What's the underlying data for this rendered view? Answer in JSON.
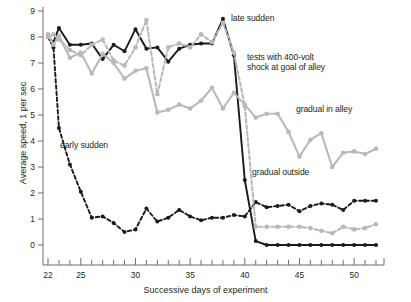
{
  "chart_data": {
    "type": "line",
    "title": "",
    "xlabel": "Successive days of experiment",
    "ylabel": "Average speed, 1 per sec",
    "xlim": [
      21.4,
      52.6
    ],
    "ylim": [
      -0.35,
      9.0
    ],
    "xticks_major": [
      22,
      25,
      30,
      35,
      40,
      45,
      50
    ],
    "xticks_minor_range": [
      22,
      52
    ],
    "yticks": [
      0,
      1,
      2,
      3,
      4,
      5,
      6,
      7,
      8,
      9
    ],
    "grid": false,
    "legend": "annotations-inline",
    "colors": {
      "black": "#1a1a1a",
      "gray": "#b9b9b9",
      "axis": "#6d6d6d",
      "text": "#231f20"
    },
    "series": [
      {
        "name": "late sudden",
        "color": "#1a1a1a",
        "style": "solid",
        "x": [
          22,
          22.5,
          23,
          24,
          25,
          26,
          27,
          28,
          29,
          30,
          31,
          32,
          33,
          34,
          35,
          36,
          37,
          38,
          39,
          40,
          41,
          42,
          43,
          44,
          45,
          46,
          47,
          48,
          49,
          50,
          51,
          52
        ],
        "y": [
          8.0,
          7.8,
          8.35,
          7.7,
          7.7,
          7.75,
          7.15,
          7.7,
          7.45,
          8.3,
          7.55,
          7.6,
          7.05,
          7.55,
          7.7,
          7.75,
          7.75,
          8.7,
          7.3,
          2.5,
          0.15,
          0.0,
          0.0,
          0.0,
          0.0,
          0.0,
          0.0,
          0.0,
          0.0,
          0.0,
          0.0,
          0.0
        ]
      },
      {
        "name": "early sudden",
        "color": "#1a1a1a",
        "style": "dashed",
        "x": [
          22,
          22.5,
          23,
          24,
          25,
          26,
          27,
          28,
          29,
          30,
          31,
          32,
          33,
          34,
          35,
          36,
          37,
          38,
          39,
          40,
          41,
          42,
          43,
          44,
          45,
          46,
          47,
          48,
          49,
          50,
          51,
          52
        ],
        "y": [
          8.0,
          7.6,
          4.5,
          3.1,
          2.05,
          1.05,
          1.1,
          0.85,
          0.5,
          0.6,
          1.4,
          0.9,
          1.05,
          1.35,
          1.1,
          0.95,
          1.05,
          1.05,
          1.15,
          1.1,
          1.65,
          1.45,
          1.5,
          1.55,
          1.3,
          1.5,
          1.6,
          1.55,
          1.35,
          1.7,
          1.7,
          1.7
        ]
      },
      {
        "name": "gradual in alley",
        "color": "#b9b9b9",
        "style": "solid",
        "x": [
          22,
          22.5,
          23,
          24,
          25,
          26,
          27,
          28,
          29,
          30,
          31,
          32,
          33,
          34,
          35,
          36,
          37,
          38,
          39,
          40,
          41,
          42,
          43,
          44,
          45,
          46,
          47,
          48,
          49,
          50,
          51,
          52
        ],
        "y": [
          8.1,
          7.7,
          8.05,
          7.2,
          7.4,
          6.6,
          7.35,
          7.0,
          6.4,
          6.7,
          6.8,
          5.1,
          5.2,
          5.4,
          5.25,
          5.55,
          6.05,
          5.25,
          5.85,
          5.4,
          4.9,
          5.05,
          5.05,
          4.35,
          3.4,
          4.05,
          4.3,
          3.0,
          3.55,
          3.6,
          3.5,
          3.7
        ]
      },
      {
        "name": "gradual outside",
        "color": "#b9b9b9",
        "style": "dashed",
        "x": [
          22,
          22.5,
          23,
          24,
          25,
          26,
          27,
          28,
          29,
          30,
          31,
          32,
          33,
          34,
          35,
          36,
          37,
          38,
          39,
          40,
          41,
          42,
          43,
          44,
          45,
          46,
          47,
          48,
          49,
          50,
          51,
          52
        ],
        "y": [
          8.0,
          8.1,
          7.9,
          7.5,
          7.3,
          7.7,
          7.9,
          7.1,
          6.9,
          7.6,
          8.65,
          5.8,
          7.6,
          7.75,
          7.6,
          8.1,
          7.8,
          8.55,
          7.4,
          5.35,
          0.7,
          0.7,
          0.7,
          0.7,
          0.7,
          0.65,
          0.55,
          0.45,
          0.7,
          0.6,
          0.65,
          0.8
        ]
      }
    ],
    "annotations": [
      {
        "key": "late_sudden",
        "text": "late sudden"
      },
      {
        "key": "tests_shock",
        "text": "tests with 400-volt\nshock at goal of alley"
      },
      {
        "key": "gradual_in_alley",
        "text": "gradual in alley"
      },
      {
        "key": "gradual_outside",
        "text": "gradual outside"
      },
      {
        "key": "early_sudden",
        "text": "early sudden"
      }
    ]
  },
  "annotations": {
    "late_sudden": "late sudden",
    "tests_shock_line1": "tests with 400-volt",
    "tests_shock_line2": "shock at goal of alley",
    "gradual_in_alley": "gradual in alley",
    "gradual_outside": "gradual outside",
    "early_sudden": "early sudden"
  },
  "axes": {
    "ylabel": "Average speed, 1 per sec",
    "xlabel": "Successive days of experiment",
    "ytick_labels": [
      "0",
      "1",
      "2",
      "3",
      "4",
      "5",
      "6",
      "7",
      "8",
      "9"
    ],
    "xtick_labels": [
      "22",
      "25",
      "30",
      "35",
      "40",
      "45",
      "50"
    ]
  }
}
